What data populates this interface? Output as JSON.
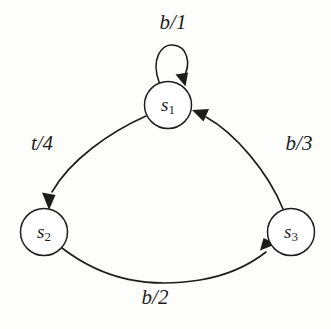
{
  "diagram": {
    "type": "state-transition-diagram",
    "title": "",
    "background_color": "#fdfdfc",
    "stroke_color": "#1d1d1d",
    "node_fill_color": "#ffffff",
    "states": [
      {
        "id": "s1",
        "label_base": "s",
        "label_sub": "1",
        "cx": 168,
        "cy": 105,
        "r": 23.5
      },
      {
        "id": "s2",
        "label_base": "s",
        "label_sub": "2",
        "cx": 44,
        "cy": 232,
        "r": 23.5
      },
      {
        "id": "s3",
        "label_base": "s",
        "label_sub": "3",
        "cx": 291,
        "cy": 232,
        "r": 23.5
      }
    ],
    "transitions": [
      {
        "id": "t-s1-s1",
        "from": "s1",
        "to": "s1",
        "input": "b",
        "output": "1",
        "label": "b/1",
        "kind": "self-loop",
        "label_x": 173,
        "label_y": 22
      },
      {
        "id": "t-s1-s2",
        "from": "s1",
        "to": "s2",
        "input": "t",
        "output": "4",
        "label": "t/4",
        "kind": "arc",
        "label_x": 42,
        "label_y": 143
      },
      {
        "id": "t-s2-s3",
        "from": "s2",
        "to": "s3",
        "input": "b",
        "output": "2",
        "label": "b/2",
        "kind": "arc",
        "label_x": 155,
        "label_y": 297
      },
      {
        "id": "t-s3-s1",
        "from": "s3",
        "to": "s1",
        "input": "b",
        "output": "3",
        "label": "b/3",
        "kind": "arc",
        "label_x": 299,
        "label_y": 143
      }
    ]
  }
}
